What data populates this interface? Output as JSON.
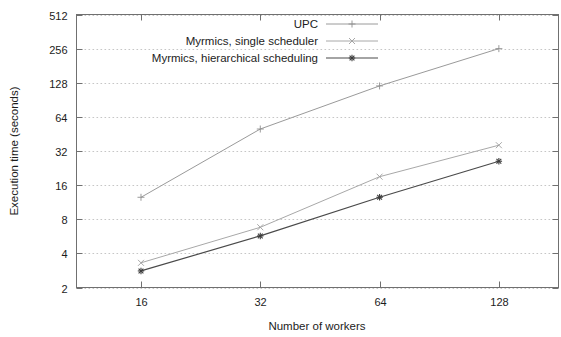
{
  "chart_data": {
    "type": "line",
    "title": "",
    "xlabel": "Number of workers",
    "ylabel": "Execution time (seconds)",
    "x": [
      16,
      32,
      64,
      128
    ],
    "xtick_labels": [
      "16",
      "32",
      "64",
      "128"
    ],
    "ytick_labels": [
      "2",
      "4",
      "8",
      "16",
      "32",
      "64",
      "128",
      "256",
      "512"
    ],
    "ytick_values": [
      2,
      4,
      8,
      16,
      32,
      64,
      128,
      256,
      512
    ],
    "xscale": "log2",
    "yscale": "log2",
    "xlim": [
      11,
      181
    ],
    "ylim": [
      2,
      512
    ],
    "grid": true,
    "legend_position": "top-center",
    "series": [
      {
        "name": "UPC",
        "marker": "plus",
        "color": "#9a9a9a",
        "values": [
          12.5,
          50,
          120,
          256
        ]
      },
      {
        "name": "Myrmics, single scheduler",
        "marker": "cross",
        "color": "#a8a8a8",
        "values": [
          3.3,
          6.8,
          19,
          36
        ]
      },
      {
        "name": "Myrmics, hierarchical scheduling",
        "marker": "star",
        "color": "#4a4a4a",
        "values": [
          2.8,
          5.7,
          12.5,
          26
        ]
      }
    ]
  },
  "figure": {
    "background": "#ffffff",
    "axis_color": "#707070",
    "grid_color": "#b8b8b8"
  }
}
